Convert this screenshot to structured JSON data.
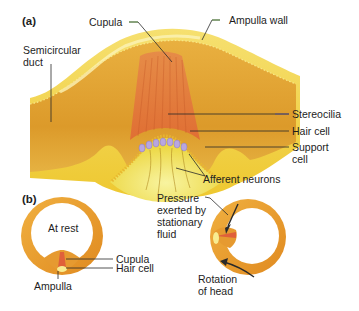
{
  "figure": {
    "panels": [
      {
        "id": "a",
        "label": "(a)"
      },
      {
        "id": "b",
        "label": "(b)"
      }
    ],
    "panel_a": {
      "labels": {
        "cupula": "Cupula",
        "ampulla_wall": "Ampulla wall",
        "semicircular_duct": "Semicircular\nduct",
        "stereocilia": "Stereocilia",
        "hair_cell": "Hair cell",
        "support_cell": "Support\ncell",
        "afferent_neurons": "Afferent neurons"
      }
    },
    "panel_b": {
      "left": {
        "state": "At rest",
        "cupula": "Cupula",
        "hair_cell": "Hair cell",
        "ampulla": "Ampulla"
      },
      "right": {
        "pressure": "Pressure\nexerted by\nstationary\nfluid",
        "rotation": "Rotation\nof head"
      }
    },
    "colors": {
      "wall_yellow": "#f2d43a",
      "duct_orange": "#e0a030",
      "cupula_red": "#e0703a",
      "hair_cell_purple": "#b8a6e0",
      "leader_line": "#2a2a2a",
      "leader_green": "#5a9a3a",
      "leader_blue": "#4a4aa0"
    }
  }
}
